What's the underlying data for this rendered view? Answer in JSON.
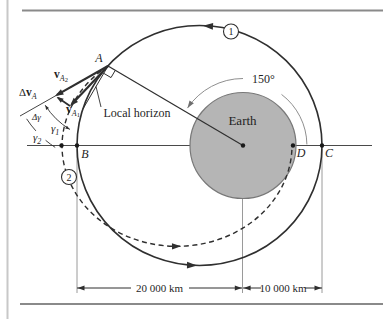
{
  "figure": {
    "type": "orbital-mechanics-diagram",
    "points": {
      "A": "A",
      "B": "B",
      "C": "C",
      "D": "D"
    },
    "earth_label": "Earth",
    "orbit1_badge": "1",
    "orbit2_badge": "2",
    "true_anomaly_label": "150°",
    "local_horizon_label": "Local horizon",
    "dimensions": {
      "left": "20 000 km",
      "right": "10 000 km"
    },
    "angle_labels": {
      "delta_gamma": "Δγ",
      "gamma1_base": "γ",
      "gamma1_sub": "1",
      "gamma2_base": "γ",
      "gamma2_sub": "2"
    },
    "vector_labels": {
      "dv_prefix": "Δ",
      "dv_base": "v",
      "dv_sub": "A",
      "v1_base": "v",
      "v1_sub": "A",
      "v1_subsub": "1",
      "v2_base": "v",
      "v2_sub": "A",
      "v2_subsub": "2"
    },
    "colors": {
      "earth_fill": "#b5b5b5",
      "earth_stroke": "#787878",
      "line": "#2f2f2f",
      "thin_arc_gray": "#8f8f8f",
      "frame_rule": "#8a8a8a",
      "left_rule": "#c8c8c8"
    }
  }
}
